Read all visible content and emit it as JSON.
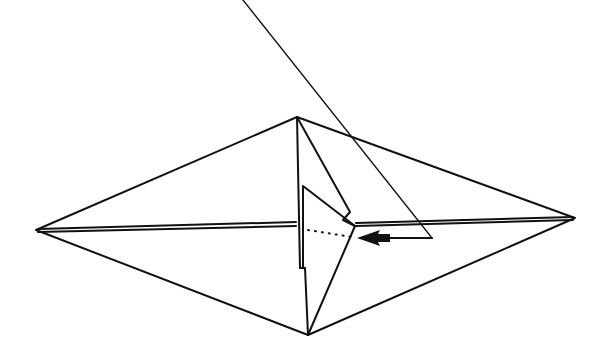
{
  "diagram": {
    "type": "origami-step",
    "stroke_color": "#111111",
    "background": "#ffffff",
    "elements": {
      "outline": "diamond base",
      "center_crease": "double line horizontal",
      "flap": "triangular flap folded at center",
      "fold_line": "dotted valley fold line",
      "arrow": "push/fold arrow pointing left",
      "guide_line": "thin diagonal reference line"
    }
  }
}
